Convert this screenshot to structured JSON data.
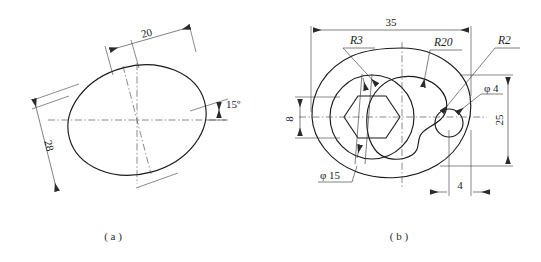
{
  "page": {
    "background_color": "#ffffff",
    "line_color": "#1a1a1a",
    "thin_line_color": "#3a3a3a",
    "width": 541,
    "height": 262
  },
  "figures": [
    {
      "id": "figure-a",
      "caption": "( a )",
      "description": "tilted ellipse with centerlines",
      "dimensions": [
        {
          "name": "minor-axis",
          "label": "20"
        },
        {
          "name": "major-axis",
          "label": "28"
        },
        {
          "name": "tilt-angle",
          "label": "15º"
        }
      ]
    },
    {
      "id": "figure-b",
      "caption": "( b )",
      "description": "oval plate with hexagon socket, cam contour and small hole",
      "dimensions": [
        {
          "name": "overall-width",
          "label": "35"
        },
        {
          "name": "overall-height",
          "label": "25"
        },
        {
          "name": "hex-across-flats",
          "label": "8"
        },
        {
          "name": "hole-offset",
          "label": "4"
        },
        {
          "name": "boss-diameter",
          "label": "φ 15"
        },
        {
          "name": "small-hole-diameter",
          "label": "φ 4"
        }
      ],
      "radii": [
        {
          "name": "radius-r3",
          "label": "R3"
        },
        {
          "name": "radius-r20",
          "label": "R20"
        },
        {
          "name": "radius-r2",
          "label": "R2"
        }
      ]
    }
  ],
  "labels": {
    "a": {
      "d20": "20",
      "d28": "28",
      "angle15": "15º",
      "caption": "( a )"
    },
    "b": {
      "d35": "35",
      "d25": "25",
      "d8": "8",
      "d4": "4",
      "phi15": "φ 15",
      "phi4": "φ 4",
      "r3": "R3",
      "r20": "R20",
      "r2": "R2",
      "caption": "( b )"
    }
  }
}
